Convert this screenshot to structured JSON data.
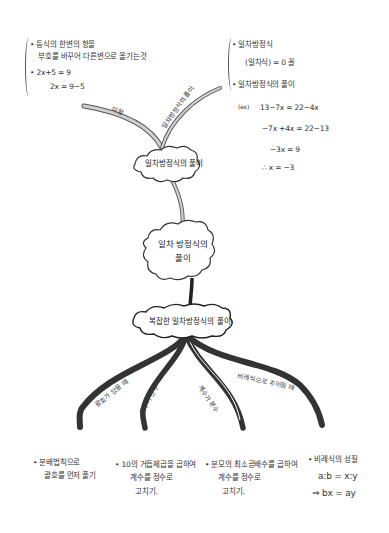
{
  "title": "일차방정식의 풀이",
  "central_node": {
    "line1": "일차 방정식의",
    "line2": "풀이"
  },
  "upper_node": {
    "label": "일차방정식의 풀이"
  },
  "lower_node": {
    "label": "복잡한 일차방정식의 풀이"
  },
  "upper_branches": [
    {
      "label": "이항",
      "notes": {
        "line1": "등식의 한변의 항을",
        "line2": "부호를 바꾸어 다른변으로 옮기는것",
        "example1": "2x+5 = 9",
        "example2": "2x = 9−5"
      }
    },
    {
      "label": "일차방정식의 풀이",
      "notes": {
        "def_title": "일차방정식",
        "def_form": "(일차식) = 0 꼴",
        "solve_title": "일차방정식의 풀이",
        "ex_prefix": "(ex)",
        "step1": "13−7x = 22−4x",
        "step2": "−7x +4x = 22−13",
        "step3": "−3x = 9",
        "step4": "∴ x = −3"
      }
    }
  ],
  "lower_branches": [
    {
      "label": "괄호가 있을 때",
      "note_line1": "분배법칙으로",
      "note_line2": "괄호를 먼저 풀기",
      "note_line3": ""
    },
    {
      "label": "계수가 소수",
      "note_line1": "10의 거듭제곱을 곱하여",
      "note_line2": "계수를 정수로",
      "note_line3": "고치기."
    },
    {
      "label": "계수가 분수",
      "note_line1": "분모의 최소공배수를 곱하여",
      "note_line2": "계수를 정수로",
      "note_line3": "고치기."
    },
    {
      "label": "비례식으로 주어질 때",
      "note_line1": "비례식의 성질",
      "note_line2": "a:b = x:y",
      "note_line3": "⇒ bx = ay"
    }
  ],
  "colors": {
    "ink": "#2a2a2a",
    "branch_light": "#cfcfcf",
    "branch_dark": "#3a3a3a",
    "paper": "#ffffff"
  }
}
